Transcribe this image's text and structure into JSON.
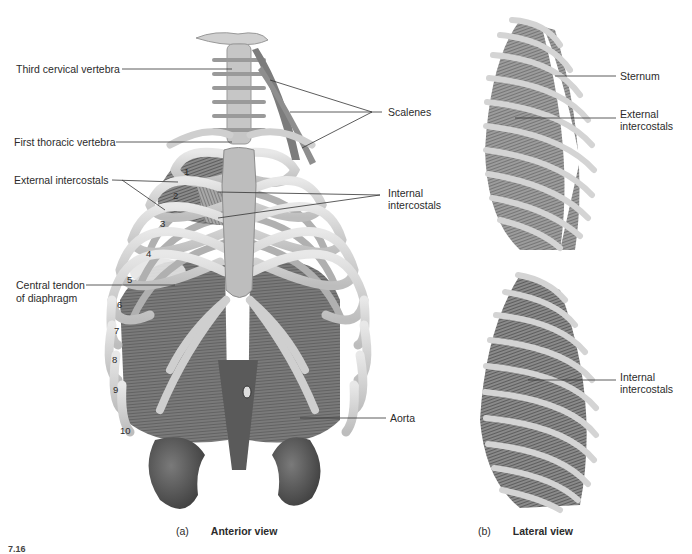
{
  "figure": {
    "panels": [
      {
        "id": "a",
        "letter": "(a)",
        "view": "Anterior view",
        "labels": {
          "third_cervical": "Third cervical vertebra",
          "first_thoracic": "First thoracic vertebra",
          "external_intercostals": "External intercostals",
          "central_tendon_1": "Central tendon",
          "central_tendon_2": "of diaphragm",
          "scalenes": "Scalenes",
          "internal_intercostals_1": "Internal",
          "internal_intercostals_2": "intercostals",
          "aorta": "Aorta"
        },
        "rib_numbers": [
          "1",
          "2",
          "3",
          "4",
          "5",
          "6",
          "7",
          "8",
          "9",
          "10"
        ]
      },
      {
        "id": "b",
        "letter": "(b)",
        "view": "Lateral view",
        "labels": {
          "sternum": "Sternum",
          "external_intercostals_1": "External",
          "external_intercostals_2": "intercostals",
          "internal_intercostals_1": "Internal",
          "internal_intercostals_2": "intercostals"
        }
      }
    ],
    "figure_number": "7.16"
  },
  "colors": {
    "bone": "#d9d9d9",
    "bone_edge": "#9a9a9a",
    "muscle": "#6e6e6e",
    "organ": "#555555",
    "leader": "#333333"
  }
}
